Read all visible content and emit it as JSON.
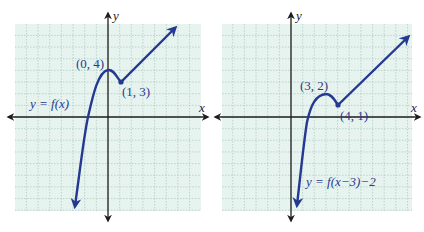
{
  "chart_data": [
    {
      "type": "line",
      "title": "",
      "label": "y = f(x)",
      "xlabel": "x",
      "ylabel": "y",
      "grid": true,
      "xlim": [
        -8,
        8
      ],
      "ylim": [
        -8,
        8
      ],
      "points": [
        {
          "x": -2.8,
          "y": -7.8
        },
        {
          "x": -1.8,
          "y": 0
        },
        {
          "x": 0,
          "y": 4
        },
        {
          "x": 1,
          "y": 3
        },
        {
          "x": 5.9,
          "y": 7.8
        }
      ],
      "annotations": [
        {
          "text": "(0, 4)",
          "x": 0,
          "y": 4
        },
        {
          "text": "(1, 3)",
          "x": 1,
          "y": 3
        }
      ]
    },
    {
      "type": "line",
      "title": "",
      "label": "y = f(x−3)−2",
      "xlabel": "x",
      "ylabel": "y",
      "grid": true,
      "xlim": [
        -6,
        10
      ],
      "ylim": [
        -8,
        8
      ],
      "points": [
        {
          "x": 0.2,
          "y": -7.8
        },
        {
          "x": 1.2,
          "y": 0
        },
        {
          "x": 3,
          "y": 2
        },
        {
          "x": 4,
          "y": 1
        },
        {
          "x": 10.1,
          "y": 7.0
        }
      ],
      "annotations": [
        {
          "text": "(3, 2)",
          "x": 3,
          "y": 2
        },
        {
          "text": "(4, 1)",
          "x": 4,
          "y": 1
        }
      ]
    }
  ],
  "left": {
    "func_label": "y = f(x)",
    "x_axis": "x",
    "y_axis": "y",
    "point_max": "(0, 4)",
    "point_min": "(1, 3)"
  },
  "right": {
    "func_label": "y = f(x−3)−2",
    "x_axis": "x",
    "y_axis": "y",
    "point_max": "(3, 2)",
    "point_min": "(4, 1)"
  },
  "colors": {
    "curve": "#253892",
    "grid_bg": "#e6f3ee",
    "grid_line": "#a9c9bd",
    "axis": "#1e1e1e",
    "label": "#2a3a8c"
  }
}
